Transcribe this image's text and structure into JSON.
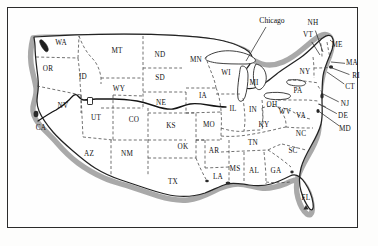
{
  "figure": {
    "kind": "map",
    "style": "vintage engraved line map, dashed state borders, hachured coastline",
    "frame_color": "#2b2b2b",
    "background_color": "#fefefe",
    "ink_color": "#121212"
  },
  "annotations": [
    {
      "name": "city-label-chicago",
      "text": "Chicago",
      "x": 272,
      "y": 21,
      "leader_to_x": 246,
      "leader_to_y": 61
    }
  ],
  "route": {
    "name": "transcontinental-route-line",
    "label": "",
    "color": "#1a1a1a",
    "description": "dark solid line crossing from California through Nevada, Utah, Wyoming, Nebraska, Iowa"
  },
  "markers": [
    {
      "name": "lake-marker-great-salt-lake",
      "x": 90,
      "y": 101
    }
  ],
  "state_labels": [
    {
      "abbr": "WA",
      "name": "Washington",
      "x": 61,
      "y": 44
    },
    {
      "abbr": "OR",
      "name": "Oregon",
      "x": 48,
      "y": 70
    },
    {
      "abbr": "ID",
      "name": "Idaho",
      "x": 83,
      "y": 78
    },
    {
      "abbr": "MT",
      "name": "Montana",
      "x": 117,
      "y": 52
    },
    {
      "abbr": "ND",
      "name": "North Dakota",
      "x": 160,
      "y": 56
    },
    {
      "abbr": "MN",
      "name": "Minnesota",
      "x": 196,
      "y": 61
    },
    {
      "abbr": "SD",
      "name": "South Dakota",
      "x": 160,
      "y": 79
    },
    {
      "abbr": "WY",
      "name": "Wyoming",
      "x": 119,
      "y": 90
    },
    {
      "abbr": "NE",
      "name": "Nebraska",
      "x": 161,
      "y": 104
    },
    {
      "abbr": "IA",
      "name": "Iowa",
      "x": 203,
      "y": 97
    },
    {
      "abbr": "WI",
      "name": "Wisconsin",
      "x": 226,
      "y": 74
    },
    {
      "abbr": "MI",
      "name": "Michigan",
      "x": 254,
      "y": 84
    },
    {
      "abbr": "NV",
      "name": "Nevada",
      "x": 63,
      "y": 107
    },
    {
      "abbr": "UT",
      "name": "Utah",
      "x": 96,
      "y": 119
    },
    {
      "abbr": "CO",
      "name": "Colorado",
      "x": 134,
      "y": 121
    },
    {
      "abbr": "KS",
      "name": "Kansas",
      "x": 171,
      "y": 127
    },
    {
      "abbr": "MO",
      "name": "Missouri",
      "x": 209,
      "y": 126
    },
    {
      "abbr": "IL",
      "name": "Illinois",
      "x": 233,
      "y": 110
    },
    {
      "abbr": "IN",
      "name": "Indiana",
      "x": 253,
      "y": 111
    },
    {
      "abbr": "OH",
      "name": "Ohio",
      "x": 272,
      "y": 106
    },
    {
      "abbr": "PA",
      "name": "Pennsylvania",
      "x": 298,
      "y": 92
    },
    {
      "abbr": "NY",
      "name": "New York",
      "x": 305,
      "y": 73
    },
    {
      "abbr": "CA",
      "name": "California",
      "x": 41,
      "y": 129
    },
    {
      "abbr": "AZ",
      "name": "Arizona",
      "x": 89,
      "y": 155
    },
    {
      "abbr": "NM",
      "name": "New Mexico",
      "x": 127,
      "y": 155
    },
    {
      "abbr": "OK",
      "name": "Oklahoma",
      "x": 183,
      "y": 148
    },
    {
      "abbr": "AR",
      "name": "Arkansas",
      "x": 214,
      "y": 152
    },
    {
      "abbr": "TX",
      "name": "Texas",
      "x": 173,
      "y": 183
    },
    {
      "abbr": "LA",
      "name": "Louisiana",
      "x": 218,
      "y": 178
    },
    {
      "abbr": "MS",
      "name": "Mississippi",
      "x": 235,
      "y": 170
    },
    {
      "abbr": "AL",
      "name": "Alabama",
      "x": 254,
      "y": 172
    },
    {
      "abbr": "GA",
      "name": "Georgia",
      "x": 276,
      "y": 172
    },
    {
      "abbr": "TN",
      "name": "Tennessee",
      "x": 253,
      "y": 144
    },
    {
      "abbr": "KY",
      "name": "Kentucky",
      "x": 264,
      "y": 126
    },
    {
      "abbr": "WV",
      "name": "West Virginia",
      "x": 285,
      "y": 113
    },
    {
      "abbr": "VA",
      "name": "Virginia",
      "x": 301,
      "y": 117
    },
    {
      "abbr": "NC",
      "name": "North Carolina",
      "x": 301,
      "y": 135
    },
    {
      "abbr": "SC",
      "name": "South Carolina",
      "x": 293,
      "y": 152
    },
    {
      "abbr": "FL",
      "name": "Florida",
      "x": 306,
      "y": 199
    }
  ],
  "callout_labels": [
    {
      "abbr": "NH",
      "name": "New Hampshire",
      "x": 313,
      "y": 24,
      "to_x": 323,
      "to_y": 52
    },
    {
      "abbr": "VT",
      "name": "Vermont",
      "x": 308,
      "y": 36,
      "to_x": 320,
      "to_y": 55
    },
    {
      "abbr": "ME",
      "name": "Maine",
      "x": 337,
      "y": 46,
      "to_x": 330,
      "to_y": 40
    },
    {
      "abbr": "MA",
      "name": "Massachusetts",
      "x": 352,
      "y": 64,
      "to_x": 331,
      "to_y": 62
    },
    {
      "abbr": "RI",
      "name": "Rhode Island",
      "x": 356,
      "y": 77,
      "to_x": 332,
      "to_y": 68
    },
    {
      "abbr": "CT",
      "name": "Connecticut",
      "x": 350,
      "y": 88,
      "to_x": 327,
      "to_y": 72
    },
    {
      "abbr": "NJ",
      "name": "New Jersey",
      "x": 345,
      "y": 105,
      "to_x": 321,
      "to_y": 93
    },
    {
      "abbr": "DE",
      "name": "Delaware",
      "x": 343,
      "y": 117,
      "to_x": 319,
      "to_y": 104
    },
    {
      "abbr": "MD",
      "name": "Maryland",
      "x": 345,
      "y": 130,
      "to_x": 317,
      "to_y": 110
    }
  ]
}
